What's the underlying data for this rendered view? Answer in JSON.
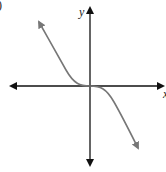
{
  "figure": {
    "part_label": ")",
    "y_axis_label": "y",
    "x_axis_label": "x",
    "colors": {
      "axes": "#111111",
      "curve": "#777777",
      "background": "#ffffff"
    },
    "axes": {
      "origin_px": [
        90,
        86
      ],
      "x_axis_px": [
        10,
        164
      ],
      "y_axis_px": [
        8,
        165
      ]
    },
    "curve": {
      "shape": "cubic, decreasing, inflection at origin",
      "start_px": [
        38,
        21
      ],
      "end_px": [
        139,
        149
      ]
    }
  }
}
